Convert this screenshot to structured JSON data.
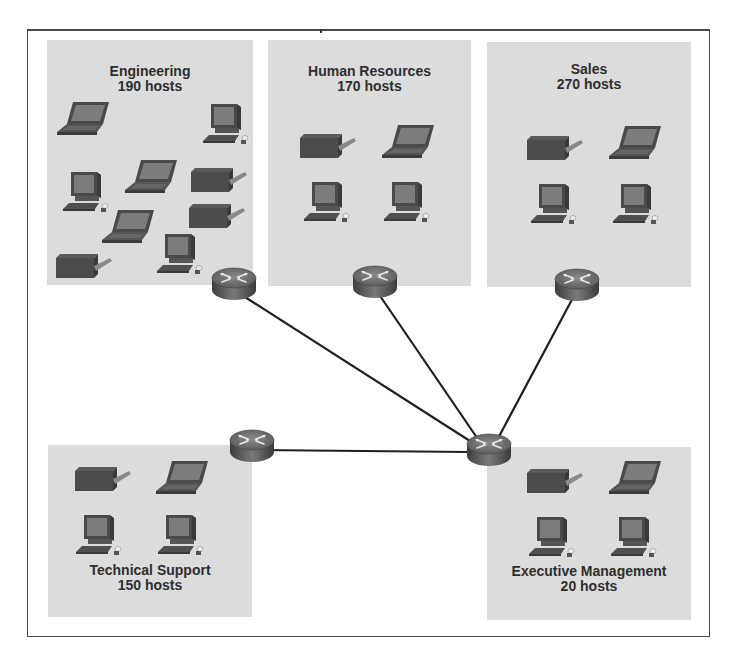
{
  "diagram": {
    "type": "network-topology",
    "colors": {
      "zone_fill": "#dcdcdc",
      "frame": "#4a4a4a",
      "link": "#1e1e1e",
      "router_body": "#6c6c6c",
      "device": "#555555",
      "title_text": "#2e2e2e"
    },
    "zones": [
      {
        "id": "engineering",
        "name": "Engineering",
        "hosts": "190 hosts",
        "devices": [
          "laptop",
          "pc",
          "pc",
          "laptop",
          "printer",
          "laptop",
          "printer",
          "printer",
          "pc"
        ]
      },
      {
        "id": "human-resources",
        "name": "Human Resources",
        "hosts": "170 hosts",
        "devices": [
          "printer",
          "laptop",
          "pc",
          "pc"
        ]
      },
      {
        "id": "sales",
        "name": "Sales",
        "hosts": "270 hosts",
        "devices": [
          "printer",
          "laptop",
          "pc",
          "pc"
        ]
      },
      {
        "id": "technical-support",
        "name": "Technical Support",
        "hosts": "150 hosts",
        "devices": [
          "printer",
          "laptop",
          "pc",
          "pc"
        ]
      },
      {
        "id": "executive-management",
        "name": "Executive Management",
        "hosts": "20 hosts",
        "devices": [
          "printer",
          "laptop",
          "pc",
          "pc"
        ]
      }
    ],
    "routers": [
      {
        "id": "r-engineering",
        "label": "Engineering router"
      },
      {
        "id": "r-hr",
        "label": "Human Resources router"
      },
      {
        "id": "r-sales",
        "label": "Sales router"
      },
      {
        "id": "r-techsupport",
        "label": "Technical Support router"
      },
      {
        "id": "r-core",
        "label": "Executive Management / core router"
      }
    ],
    "links": [
      [
        "r-engineering",
        "r-core"
      ],
      [
        "r-hr",
        "r-core"
      ],
      [
        "r-sales",
        "r-core"
      ],
      [
        "r-techsupport",
        "r-core"
      ]
    ]
  }
}
